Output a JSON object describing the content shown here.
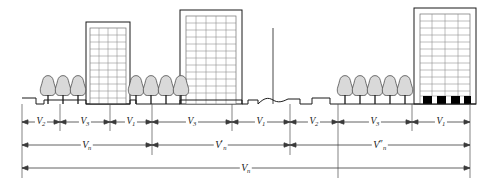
{
  "figure": {
    "colors": {
      "line": "#1a1a1a",
      "dimension_line": "#555555",
      "tree_fill": "#d8d8d8",
      "building_fill": "#ffffff",
      "window_line": "#8a8a8a",
      "door_fill": "#000000",
      "background": "#ffffff"
    },
    "break_symbol": "center-break-curve"
  },
  "scene": {
    "buildings": [
      {
        "id": "building-1",
        "name": "mid-rise-left",
        "x": 86,
        "y": 22,
        "width": 44,
        "height": 82,
        "window_cols": 4,
        "window_rows": 11,
        "has_ground_doors": false
      },
      {
        "id": "building-2",
        "name": "tower-left-center",
        "x": 180,
        "y": 10,
        "width": 62,
        "height": 94,
        "window_cols": 5,
        "window_rows": 12,
        "has_ground_doors": false
      },
      {
        "id": "building-3",
        "name": "tower-right",
        "x": 414,
        "y": 8,
        "width": 62,
        "height": 96,
        "window_cols": 4,
        "window_rows": 12,
        "has_ground_doors": true,
        "door_count": 4
      }
    ],
    "tree_groups": [
      {
        "id": "tree-group-1",
        "count": 3,
        "start_x": 48,
        "spacing": 15,
        "base_y": 104
      },
      {
        "id": "tree-group-2",
        "count": 4,
        "start_x": 136,
        "spacing": 15,
        "base_y": 104
      },
      {
        "id": "tree-group-3",
        "count": 5,
        "start_x": 345,
        "spacing": 15,
        "base_y": 104
      }
    ],
    "ground_profile_description": "stepped sidewalk and roadway profile with central break"
  },
  "dimension_rows": {
    "row1": {
      "name": "segment-dimensions",
      "y": 122,
      "segments": [
        {
          "id": "seg-1",
          "label": "V",
          "sub": "2",
          "prime": "",
          "x1": 22,
          "x2": 60
        },
        {
          "id": "seg-2",
          "label": "V",
          "sub": "3",
          "prime": "",
          "x1": 60,
          "x2": 110
        },
        {
          "id": "seg-3",
          "label": "V",
          "sub": "1",
          "prime": "",
          "x1": 110,
          "x2": 152
        },
        {
          "id": "seg-4",
          "label": "V",
          "sub": "3",
          "prime": "",
          "x1": 152,
          "x2": 232
        },
        {
          "id": "seg-5",
          "label": "V",
          "sub": "1",
          "prime": "",
          "x1": 232,
          "x2": 290
        },
        {
          "id": "seg-6",
          "label": "V",
          "sub": "2",
          "prime": "",
          "x1": 290,
          "x2": 338
        },
        {
          "id": "seg-7",
          "label": "V",
          "sub": "3",
          "prime": "",
          "x1": 338,
          "x2": 412
        },
        {
          "id": "seg-8",
          "label": "V",
          "sub": "1",
          "prime": "",
          "x1": 412,
          "x2": 470
        }
      ]
    },
    "row2": {
      "name": "block-dimensions",
      "y": 145,
      "segments": [
        {
          "id": "blk-1",
          "label": "V",
          "sub": "n",
          "prime": "",
          "x1": 22,
          "x2": 152
        },
        {
          "id": "blk-2",
          "label": "V",
          "sub": "n",
          "prime": "′",
          "x1": 152,
          "x2": 290
        },
        {
          "id": "blk-3",
          "label": "V",
          "sub": "n",
          "prime": "″",
          "x1": 290,
          "x2": 470
        }
      ]
    },
    "row3": {
      "name": "total-dimension",
      "y": 168,
      "segments": [
        {
          "id": "total-1",
          "label": "V",
          "sub": "n",
          "prime": "",
          "x1": 22,
          "x2": 470
        }
      ]
    }
  },
  "extension_lines": {
    "name": "vertical-extension-ticks",
    "x_positions": [
      22,
      60,
      110,
      152,
      232,
      290,
      338,
      412,
      470
    ],
    "top_y": 104,
    "bottom_y": 178
  },
  "center_axis": {
    "name": "center-line",
    "x": 273,
    "top_y": 28,
    "bottom_y": 104
  }
}
